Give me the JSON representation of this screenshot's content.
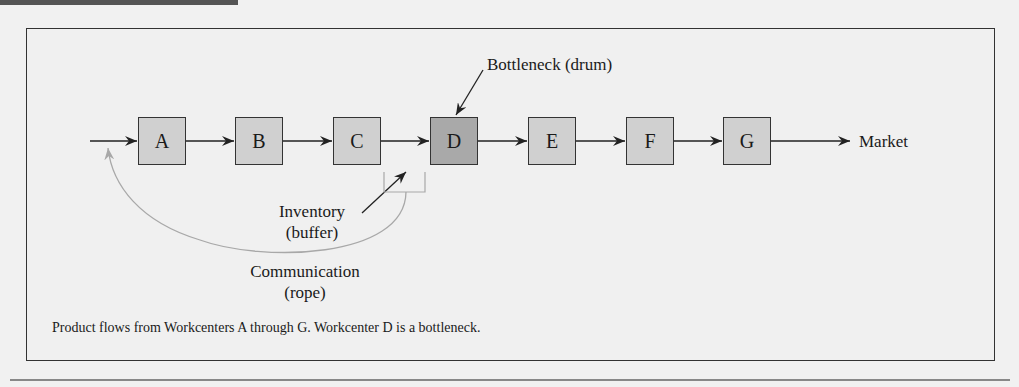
{
  "figure": {
    "workcenters": [
      {
        "id": "A",
        "label": "A",
        "bottleneck": false
      },
      {
        "id": "B",
        "label": "B",
        "bottleneck": false
      },
      {
        "id": "C",
        "label": "C",
        "bottleneck": false
      },
      {
        "id": "D",
        "label": "D",
        "bottleneck": true
      },
      {
        "id": "E",
        "label": "E",
        "bottleneck": false
      },
      {
        "id": "F",
        "label": "F",
        "bottleneck": false
      },
      {
        "id": "G",
        "label": "G",
        "bottleneck": false
      }
    ],
    "market_label": "Market",
    "bottleneck_label": "Bottleneck (drum)",
    "inventory_label_line1": "Inventory",
    "inventory_label_line2": "(buffer)",
    "communication_label_line1": "Communication",
    "communication_label_line2": "(rope)",
    "caption": "Product flows from Workcenters A through G. Workcenter D is a bottleneck.",
    "colors": {
      "workcenter_fill": "#d0d0d0",
      "bottleneck_fill": "#a9a9a9",
      "rope_color": "#a8a8a8",
      "line_color": "#222222"
    }
  }
}
